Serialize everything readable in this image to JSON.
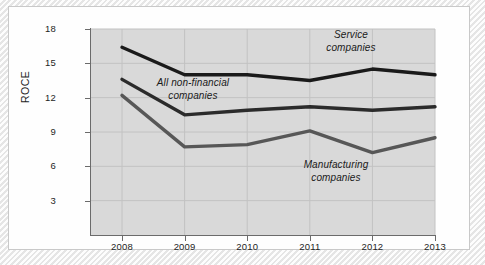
{
  "chart_data": {
    "type": "line",
    "title": "",
    "subtitle": "",
    "xlabel": "",
    "ylabel": "ROCE",
    "x": [
      2008,
      2009,
      2010,
      2011,
      2012,
      2013
    ],
    "categories": [
      "2008",
      "2009",
      "2010",
      "2011",
      "2012",
      "2013"
    ],
    "xtick_labels": [
      "2008",
      "2009",
      "2010",
      "2011",
      "2012",
      "2013"
    ],
    "ytick_labels": [
      "18",
      "15",
      "12",
      "9",
      "6",
      "3"
    ],
    "yticks": [
      18,
      15,
      12,
      9,
      6,
      3
    ],
    "ylim": [
      0,
      18
    ],
    "xlim": [
      2008,
      2013
    ],
    "grid": true,
    "grid_color": "#c2c2c2",
    "panel_background": "#d9d9d9",
    "legend_position": "inline-annotations",
    "series": [
      {
        "name": "Service companies",
        "label": "Service\ncompanies",
        "color": "#1a1a1a",
        "values": [
          16.4,
          14.0,
          14.0,
          13.5,
          14.5,
          14.0
        ]
      },
      {
        "name": "All non-financial companies",
        "label": "All non-financial\ncompanies",
        "color": "#2b2b2b",
        "values": [
          13.6,
          10.5,
          10.9,
          11.2,
          10.9,
          11.2
        ]
      },
      {
        "name": "Manufacturing companies",
        "label": "Manufacturing\ncompanies",
        "color": "#575757",
        "values": [
          12.2,
          7.7,
          7.9,
          9.1,
          7.2,
          8.5
        ]
      }
    ],
    "annotations": [
      {
        "name": "service",
        "text": "Service\ncompanies"
      },
      {
        "name": "all-non-financial",
        "text": "All non-financial\ncompanies"
      },
      {
        "name": "manufacturing",
        "text": "Manufacturing\ncompanies"
      }
    ]
  },
  "axes": {
    "y_title": "ROCE"
  }
}
